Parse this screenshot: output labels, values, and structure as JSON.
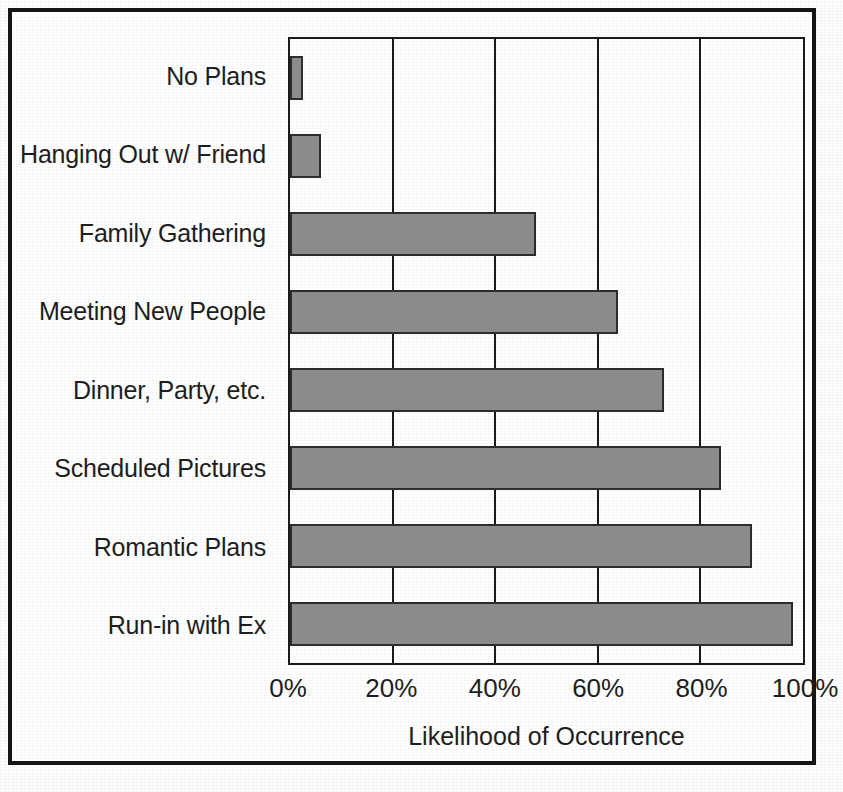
{
  "chart_data": {
    "type": "bar",
    "orientation": "horizontal",
    "title": "",
    "xlabel": "Likelihood of Occurrence",
    "ylabel": "",
    "xlim": [
      0,
      100
    ],
    "xticks": [
      "0%",
      "20%",
      "40%",
      "60%",
      "80%",
      "100%"
    ],
    "xtick_values": [
      0,
      20,
      40,
      60,
      80,
      100
    ],
    "grid": true,
    "legend": false,
    "bar_color": "#8b8b8b",
    "bar_border_color": "#2c2c2c",
    "axis_color": "#1a1a1a",
    "categories": [
      "No Plans",
      "Hanging Out w/ Friend",
      "Family Gathering",
      "Meeting New People",
      "Dinner, Party, etc.",
      "Scheduled Pictures",
      "Romantic Plans",
      "Run-in with Ex"
    ],
    "values": [
      2.5,
      6,
      48,
      64,
      73,
      84,
      90,
      98
    ],
    "series": [
      {
        "name": "Likelihood of Occurrence",
        "values": [
          2.5,
          6,
          48,
          64,
          73,
          84,
          90,
          98
        ]
      }
    ]
  }
}
